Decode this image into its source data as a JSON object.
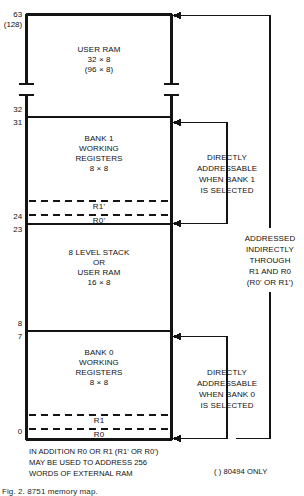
{
  "figure": {
    "caption": "Fig. 2. 8751 memory map."
  },
  "address_labels": [
    {
      "id": "addr-63",
      "text": "63",
      "x": 22,
      "y": 11,
      "note": "top of user RAM"
    },
    {
      "id": "addr-128",
      "text": "(128)",
      "x": 22,
      "y": 21,
      "note": "8049/8494 variant top"
    },
    {
      "id": "addr-32",
      "text": "32",
      "x": 22,
      "y": 111,
      "note": "top of bank 1"
    },
    {
      "id": "addr-31",
      "text": "31",
      "x": 22,
      "y": 124,
      "note": "bank 1 first register"
    },
    {
      "id": "addr-24",
      "text": "24",
      "x": 22,
      "y": 215,
      "note": "bank 1 R0' address"
    },
    {
      "id": "addr-23",
      "text": "23",
      "x": 22,
      "y": 228,
      "note": "top of stack region"
    },
    {
      "id": "addr-8",
      "text": "8",
      "x": 22,
      "y": 325,
      "note": "bottom of stack region"
    },
    {
      "id": "addr-7",
      "text": "7",
      "x": 22,
      "y": 338,
      "note": "bank 0 top register"
    },
    {
      "id": "addr-0",
      "text": "0",
      "x": 22,
      "y": 432,
      "note": "bank 0 R0 address"
    }
  ],
  "blocks": [
    {
      "id": "user-ram",
      "lines": [
        "USER RAM",
        "32 × 8",
        "(96 × 8)"
      ],
      "x": 103,
      "y": 48
    },
    {
      "id": "bank-1",
      "lines": [
        "BANK 1",
        "WORKING",
        "REGISTERS",
        "8 × 8"
      ],
      "x": 103,
      "y": 137
    },
    {
      "id": "stack",
      "lines": [
        "8 LEVEL STACK",
        "OR",
        "USER RAM",
        "16 × 8"
      ],
      "x": 103,
      "y": 252
    },
    {
      "id": "bank-0",
      "lines": [
        "BANK 0",
        "WORKING",
        "REGISTERS",
        "8 × 8"
      ],
      "x": 103,
      "y": 351
    }
  ],
  "registers": [
    {
      "id": "reg-r1-prime",
      "text": "R1'",
      "x": 103,
      "y": 205
    },
    {
      "id": "reg-r0-prime",
      "text": "R0'",
      "x": 103,
      "y": 219
    },
    {
      "id": "reg-r1",
      "text": "R1",
      "x": 103,
      "y": 419
    },
    {
      "id": "reg-r0",
      "text": "R0",
      "x": 103,
      "y": 433
    }
  ],
  "annotations": [
    {
      "id": "bank1-note",
      "lines": [
        "DIRECTLY",
        "ADDRESSABLE",
        "WHEN BANK 1",
        "IS SELECTED"
      ],
      "x": 227,
      "y": 156
    },
    {
      "id": "indirect-note",
      "lines": [
        "ADDRESSED",
        "INDIRECTLY",
        "THROUGH",
        "R1 AND R0",
        "(R0' OR R1')"
      ],
      "x": 270,
      "y": 235
    },
    {
      "id": "bank0-note",
      "lines": [
        "DIRECTLY",
        "ADDRESSABLE",
        "WHEN BANK 0",
        "IS SELECTED"
      ],
      "x": 227,
      "y": 371
    }
  ],
  "footnote": {
    "id": "external-ram-note",
    "lines": [
      "IN ADDITION R0 OR R1 (R1' OR R0')",
      "MAY BE USED TO ADDRESS 256",
      "WORDS OF EXTERNAL RAM"
    ],
    "x": 29,
    "y": 447
  },
  "variant_note": {
    "id": "variant-note",
    "text": "( ) 80494 ONLY",
    "x": 214,
    "y": 471
  },
  "colors": {
    "ink": "#111111",
    "paper": "#ffffff",
    "rule": "#1a1a1a"
  },
  "geometry": {
    "box_left": 26,
    "box_right": 172,
    "box_top": 14,
    "box_bottom": 440,
    "bracket_x": 227,
    "outer_x": 270,
    "break_top": 83,
    "break_bottom": 96,
    "divider_32": 117,
    "divider_24": 224,
    "divider_8": 331,
    "dash_r1p": 201,
    "dash_r0p": 215,
    "dash_r1": 415,
    "dash_r0": 429
  }
}
